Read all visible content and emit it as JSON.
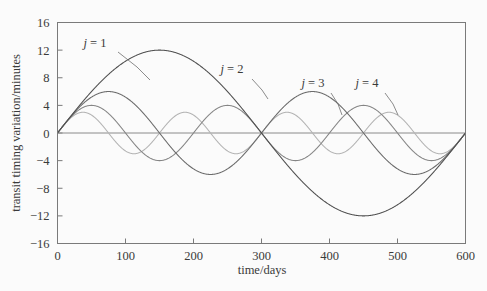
{
  "chart_data": {
    "type": "line",
    "title": "",
    "xlabel": "time/days",
    "ylabel": "transit timing variation/minutes",
    "xlim": [
      0,
      600
    ],
    "ylim": [
      -16,
      16
    ],
    "xticks": [
      0,
      100,
      200,
      300,
      400,
      500,
      600
    ],
    "yticks": [
      16,
      12,
      8,
      4,
      0,
      -4,
      -8,
      -12,
      -16
    ],
    "xtick_labels": [
      "0",
      "100",
      "200",
      "300",
      "400",
      "500",
      "600"
    ],
    "ytick_labels": [
      "16",
      "12",
      "8",
      "4",
      "0",
      "−4",
      "−8",
      "−12",
      "−16"
    ],
    "grid": false,
    "zero_line": true,
    "legend_position": "inline-annotations",
    "series": [
      {
        "name": "j = 1",
        "label_tex": "j = 1",
        "color": "#4f4f4f",
        "amplitude": 12,
        "period_days": 600,
        "cycles": 1,
        "phase": 0,
        "form": "A sin(2π j t / 600)",
        "label_x": 95,
        "label_y": 47,
        "leader": [
          [
            118,
            52
          ],
          [
            137,
            67
          ],
          [
            150,
            80
          ]
        ]
      },
      {
        "name": "j = 2",
        "label_tex": "j = 2",
        "color": "#6b6b6b",
        "amplitude": 6,
        "period_days": 300,
        "cycles": 2,
        "phase": 0,
        "form": "A sin(2π j t / 600)",
        "label_x": 232,
        "label_y": 73,
        "leader": [
          [
            252,
            79
          ],
          [
            262,
            90
          ],
          [
            268,
            99
          ]
        ]
      },
      {
        "name": "j = 3",
        "label_tex": "j = 3",
        "color": "#858585",
        "amplitude": 4,
        "period_days": 200,
        "cycles": 3,
        "phase": 0,
        "form": "A sin(2π j t / 600)",
        "label_x": 313,
        "label_y": 87,
        "leader": [
          [
            331,
            93
          ],
          [
            338,
            104
          ],
          [
            342,
            115
          ]
        ]
      },
      {
        "name": "j = 4",
        "label_tex": "j = 4",
        "color": "#b4b4b4",
        "amplitude": 3,
        "period_days": 150,
        "cycles": 4,
        "phase": 0,
        "form": "A sin(2π j t / 600)",
        "label_x": 367,
        "label_y": 87,
        "leader": [
          [
            385,
            93
          ],
          [
            393,
            104
          ],
          [
            398,
            115
          ]
        ]
      }
    ]
  },
  "axes": {
    "x_axis_title": "time/days",
    "y_axis_title": "transit timing variation/minutes"
  },
  "colors": {
    "background": "#fbfbfb",
    "frame": "#7a7a7a",
    "text": "#3a3a3a",
    "zero_line": "#8a8a8a"
  }
}
